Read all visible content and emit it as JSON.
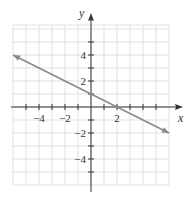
{
  "chart_data": {
    "type": "line",
    "title": "",
    "xlabel": "x",
    "ylabel": "y",
    "xlim": [
      -6,
      6
    ],
    "ylim": [
      -6,
      6.3
    ],
    "grid": true,
    "grid_step": 1,
    "x_tick_labels": [
      {
        "value": -4,
        "label": "−4"
      },
      {
        "value": -2,
        "label": "−2"
      },
      {
        "value": 2,
        "label": "2"
      }
    ],
    "y_tick_labels": [
      {
        "value": 4,
        "label": "4"
      },
      {
        "value": 2,
        "label": "2"
      },
      {
        "value": -2,
        "label": "−2"
      },
      {
        "value": -4,
        "label": "−4"
      }
    ],
    "series": [
      {
        "name": "y = -x/2 + 1",
        "slope": -0.5,
        "intercept": 1,
        "x": [
          -6,
          6
        ],
        "y": [
          4,
          -2
        ],
        "arrows": "both",
        "color": "#8a8a8a"
      }
    ],
    "key_points": [
      {
        "x": 0,
        "y": 1,
        "label": "y-intercept"
      },
      {
        "x": 2,
        "y": 0,
        "label": "x-intercept"
      }
    ]
  },
  "colors": {
    "grid": "#d9d9d9",
    "axis": "#333333",
    "line": "#8a8a8a",
    "background": "#ffffff"
  }
}
